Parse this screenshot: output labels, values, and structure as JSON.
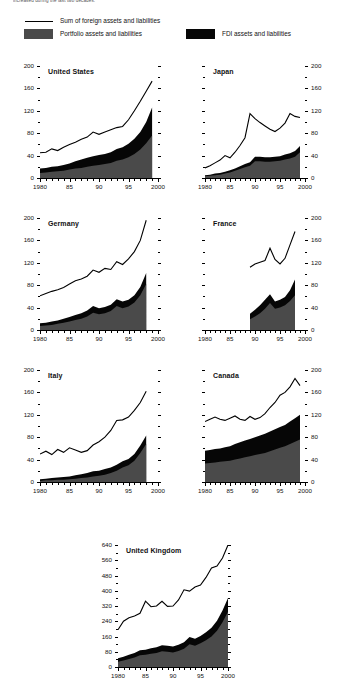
{
  "figure": {
    "caption_top": "increased during the last two decades.",
    "legend": {
      "line_label": "Sum of foreign assets and liabilities",
      "portfolio_label": "Portfolio assets and liabilities",
      "fdi_label": "FDI assets and liabilities",
      "portfolio_color": "#4a4a4a",
      "fdi_color": "#060606",
      "line_color": "#000000"
    }
  },
  "chart_data": [
    {
      "type": "area",
      "title": "United States",
      "xlabel": "",
      "ylabel": "",
      "xlim": [
        1980,
        2000
      ],
      "ylim": [
        0,
        200
      ],
      "yticks": [
        0,
        40,
        80,
        120,
        160,
        200
      ],
      "xticks": [
        1980,
        1985,
        1990,
        1995,
        2000
      ],
      "xticklabels": [
        "1980",
        "85",
        "90",
        "95",
        "2000"
      ],
      "grid": false,
      "axis_side": "left",
      "x": [
        1980,
        1981,
        1982,
        1983,
        1984,
        1985,
        1986,
        1987,
        1988,
        1989,
        1990,
        1991,
        1992,
        1993,
        1994,
        1995,
        1996,
        1997,
        1998,
        1999
      ],
      "series": [
        {
          "name": "Portfolio assets and liabilities",
          "values": [
            9,
            10,
            11,
            12,
            13,
            15,
            17,
            18,
            20,
            22,
            23,
            25,
            27,
            31,
            33,
            37,
            43,
            51,
            62,
            76
          ]
        },
        {
          "name": "FDI assets and liabilities",
          "values": [
            8,
            8,
            9,
            9,
            10,
            11,
            13,
            15,
            16,
            17,
            18,
            18,
            19,
            21,
            22,
            24,
            27,
            31,
            38,
            50
          ]
        },
        {
          "name": "Sum of foreign assets and liabilities",
          "values": [
            45,
            46,
            52,
            49,
            55,
            60,
            64,
            69,
            73,
            82,
            78,
            82,
            86,
            90,
            92,
            104,
            120,
            137,
            155,
            173
          ]
        }
      ]
    },
    {
      "type": "area",
      "title": "Japan",
      "xlabel": "",
      "ylabel": "",
      "xlim": [
        1980,
        2000
      ],
      "ylim": [
        0,
        200
      ],
      "yticks": [
        0,
        40,
        80,
        120,
        160,
        200
      ],
      "xticks": [
        1980,
        1985,
        1990,
        1995,
        2000
      ],
      "xticklabels": [
        "1980",
        "85",
        "90",
        "95",
        "2000"
      ],
      "grid": false,
      "axis_side": "right",
      "x": [
        1980,
        1981,
        1982,
        1983,
        1984,
        1985,
        1986,
        1987,
        1988,
        1989,
        1990,
        1991,
        1992,
        1993,
        1994,
        1995,
        1996,
        1997,
        1998,
        1999
      ],
      "series": [
        {
          "name": "Portfolio assets and liabilities",
          "values": [
            3,
            4,
            5,
            6,
            8,
            10,
            13,
            16,
            19,
            22,
            30,
            30,
            29,
            29,
            30,
            31,
            33,
            35,
            38,
            46
          ]
        },
        {
          "name": "FDI assets and liabilities",
          "values": [
            2,
            2,
            3,
            3,
            3,
            4,
            4,
            5,
            6,
            6,
            8,
            8,
            8,
            8,
            8,
            8,
            9,
            9,
            10,
            11
          ]
        },
        {
          "name": "Sum of foreign assets and liabilities",
          "values": [
            18,
            22,
            27,
            32,
            40,
            36,
            46,
            58,
            72,
            115,
            106,
            99,
            93,
            87,
            83,
            89,
            98,
            115,
            110,
            108
          ]
        }
      ]
    },
    {
      "type": "area",
      "title": "Germany",
      "xlabel": "",
      "ylabel": "",
      "xlim": [
        1980,
        2000
      ],
      "ylim": [
        0,
        200
      ],
      "yticks": [
        0,
        40,
        80,
        120,
        160,
        200
      ],
      "xticks": [
        1980,
        1985,
        1990,
        1995,
        2000
      ],
      "xticklabels": [
        "1980",
        "85",
        "90",
        "95",
        "2000"
      ],
      "grid": false,
      "axis_side": "left",
      "x": [
        1980,
        1981,
        1982,
        1983,
        1984,
        1985,
        1986,
        1987,
        1988,
        1989,
        1990,
        1991,
        1992,
        1993,
        1994,
        1995,
        1996,
        1997,
        1998
      ],
      "series": [
        {
          "name": "Portfolio assets and liabilities",
          "values": [
            7,
            8,
            9,
            11,
            13,
            15,
            18,
            20,
            24,
            31,
            28,
            30,
            34,
            43,
            39,
            42,
            49,
            62,
            82
          ]
        },
        {
          "name": "FDI assets and liabilities",
          "values": [
            5,
            5,
            6,
            6,
            7,
            8,
            9,
            10,
            11,
            12,
            11,
            11,
            11,
            12,
            12,
            12,
            13,
            15,
            20
          ]
        },
        {
          "name": "Sum of foreign assets and liabilities",
          "values": [
            61,
            65,
            69,
            72,
            76,
            82,
            88,
            91,
            96,
            107,
            103,
            110,
            108,
            122,
            117,
            127,
            140,
            160,
            196
          ]
        }
      ]
    },
    {
      "type": "area",
      "title": "France",
      "xlabel": "",
      "ylabel": "",
      "xlim": [
        1980,
        2000
      ],
      "ylim": [
        0,
        200
      ],
      "yticks": [
        0,
        40,
        80,
        120,
        160,
        200
      ],
      "xticks": [
        1980,
        1985,
        1990,
        1995,
        2000
      ],
      "xticklabels": [
        "1980",
        "85",
        "90",
        "95",
        "2000"
      ],
      "grid": false,
      "axis_side": "right",
      "x": [
        1989,
        1990,
        1991,
        1992,
        1993,
        1994,
        1995,
        1996,
        1997,
        1998
      ],
      "series": [
        {
          "name": "Portfolio assets and liabilities",
          "values": [
            19,
            24,
            30,
            38,
            48,
            38,
            40,
            44,
            52,
            62
          ]
        },
        {
          "name": "FDI assets and liabilities",
          "values": [
            10,
            12,
            14,
            16,
            16,
            13,
            14,
            15,
            19,
            28
          ]
        },
        {
          "name": "Sum of foreign assets and liabilities",
          "values": [
            112,
            118,
            121,
            124,
            146,
            126,
            118,
            128,
            152,
            176
          ]
        }
      ]
    },
    {
      "type": "area",
      "title": "Italy",
      "xlabel": "",
      "ylabel": "",
      "xlim": [
        1980,
        2000
      ],
      "ylim": [
        0,
        200
      ],
      "yticks": [
        0,
        40,
        80,
        120,
        160,
        200
      ],
      "xticks": [
        1980,
        1985,
        1990,
        1995,
        2000
      ],
      "xticklabels": [
        "1980",
        "85",
        "90",
        "95",
        "2000"
      ],
      "grid": false,
      "axis_side": "left",
      "x": [
        1980,
        1981,
        1982,
        1983,
        1984,
        1985,
        1986,
        1987,
        1988,
        1989,
        1990,
        1991,
        1992,
        1993,
        1994,
        1995,
        1996,
        1997,
        1998
      ],
      "series": [
        {
          "name": "Portfolio assets and liabilities",
          "values": [
            2,
            3,
            3,
            4,
            4,
            5,
            6,
            7,
            8,
            10,
            11,
            13,
            16,
            20,
            26,
            30,
            38,
            52,
            68
          ]
        },
        {
          "name": "FDI assets and liabilities",
          "values": [
            3,
            3,
            4,
            4,
            5,
            5,
            6,
            7,
            8,
            9,
            9,
            10,
            10,
            11,
            11,
            11,
            12,
            13,
            15
          ]
        },
        {
          "name": "Sum of foreign assets and liabilities",
          "values": [
            50,
            55,
            49,
            58,
            53,
            61,
            57,
            53,
            56,
            66,
            72,
            80,
            92,
            110,
            111,
            116,
            128,
            142,
            162
          ]
        }
      ]
    },
    {
      "type": "area",
      "title": "Canada",
      "xlabel": "",
      "ylabel": "",
      "xlim": [
        1980,
        2000
      ],
      "ylim": [
        0,
        200
      ],
      "yticks": [
        0,
        40,
        80,
        120,
        160,
        200
      ],
      "xticks": [
        1980,
        1985,
        1990,
        1995,
        2000
      ],
      "xticklabels": [
        "1980",
        "85",
        "90",
        "95",
        "2000"
      ],
      "grid": false,
      "axis_side": "right",
      "x": [
        1980,
        1981,
        1982,
        1983,
        1984,
        1985,
        1986,
        1987,
        1988,
        1989,
        1990,
        1991,
        1992,
        1993,
        1994,
        1995,
        1996,
        1997,
        1998,
        1999
      ],
      "series": [
        {
          "name": "Portfolio assets and liabilities",
          "values": [
            33,
            34,
            35,
            36,
            37,
            38,
            40,
            42,
            44,
            46,
            48,
            50,
            52,
            55,
            58,
            61,
            64,
            68,
            72,
            76
          ]
        },
        {
          "name": "FDI assets and liabilities",
          "values": [
            23,
            23,
            24,
            24,
            25,
            26,
            28,
            29,
            30,
            31,
            32,
            33,
            34,
            35,
            36,
            37,
            38,
            40,
            42,
            44
          ]
        },
        {
          "name": "Sum of foreign assets and liabilities",
          "values": [
            108,
            112,
            116,
            112,
            110,
            114,
            118,
            112,
            110,
            117,
            112,
            115,
            122,
            133,
            142,
            155,
            160,
            170,
            185,
            172
          ]
        }
      ]
    },
    {
      "type": "area",
      "title": "United Kingdom",
      "xlabel": "",
      "ylabel": "",
      "xlim": [
        1980,
        2000
      ],
      "ylim": [
        0,
        640
      ],
      "yticks": [
        0,
        80,
        160,
        240,
        320,
        400,
        480,
        560,
        640
      ],
      "xticks": [
        1980,
        1985,
        1990,
        1995,
        2000
      ],
      "xticklabels": [
        "1980",
        "85",
        "90",
        "95",
        "2000"
      ],
      "grid": false,
      "axis_side": "left",
      "x": [
        1980,
        1981,
        1982,
        1983,
        1984,
        1985,
        1986,
        1987,
        1988,
        1989,
        1990,
        1991,
        1992,
        1993,
        1994,
        1995,
        1996,
        1997,
        1998,
        1999,
        2000
      ],
      "series": [
        {
          "name": "Portfolio assets and liabilities",
          "values": [
            28,
            34,
            42,
            50,
            62,
            64,
            70,
            74,
            82,
            80,
            76,
            84,
            96,
            120,
            112,
            124,
            140,
            160,
            190,
            235,
            290
          ]
        },
        {
          "name": "FDI assets and liabilities",
          "values": [
            18,
            20,
            22,
            24,
            26,
            26,
            28,
            30,
            32,
            32,
            32,
            33,
            34,
            38,
            36,
            38,
            42,
            46,
            52,
            62,
            72
          ]
        },
        {
          "name": "Sum of foreign assets and liabilities",
          "values": [
            196,
            240,
            258,
            268,
            282,
            345,
            316,
            320,
            345,
            318,
            320,
            352,
            405,
            398,
            420,
            430,
            470,
            520,
            530,
            572,
            640
          ]
        }
      ]
    }
  ]
}
